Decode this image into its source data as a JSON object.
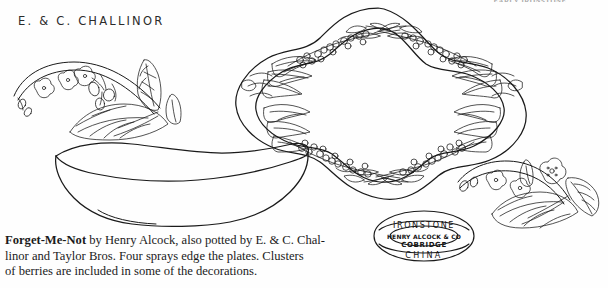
{
  "page": {
    "running_head": "EARLY IRONSTONE",
    "background_color": "#fefefe",
    "ink_color": "#1a1a1a"
  },
  "heading": {
    "maker": "E. & C. CHALLINOR"
  },
  "illustrations": [
    {
      "name": "platter",
      "label": "Forget-Me-Not platter with four floral sprays",
      "decoration": "forget-me-not sprays with leaves and berries"
    },
    {
      "name": "bowl",
      "label": "Undecorated oval vegetable bowl",
      "decoration": "plain"
    },
    {
      "name": "spray-left",
      "label": "Forget-Me-Not spray detail with berries",
      "decoration": "flowers, berries and serrated leaves"
    },
    {
      "name": "spray-right",
      "label": "Forget-Me-Not spray detail",
      "decoration": "flowers and serrated leaves"
    }
  ],
  "backstamp": {
    "label": "Maker's mark",
    "line_1": "IRONSTONE",
    "line_2": "HENRY ALCOCK & CO",
    "line_3": "COBRIDGE",
    "line_4": "CHINA"
  },
  "caption": {
    "pattern_name": "Forget-Me-Not",
    "line_1_rest": " by Henry Alcock, also potted by E. & C. Chal-",
    "line_2": "linor and Taylor Bros.  Four sprays edge the plates.  Clusters",
    "line_3": "of berries are included in some of the decorations."
  }
}
